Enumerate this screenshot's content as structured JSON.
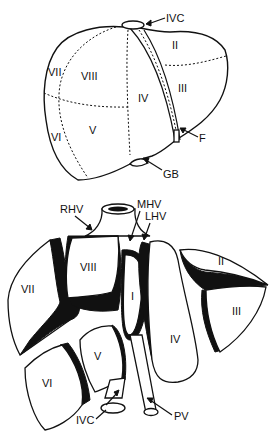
{
  "figure": {
    "top_view": {
      "segment_labels": {
        "II": "II",
        "III": "III",
        "IV": "IV",
        "V": "V",
        "VI": "VI",
        "VII": "VII",
        "VIII": "VIII"
      },
      "annotations": {
        "ivc": "IVC",
        "f": "F",
        "gb": "GB"
      }
    },
    "exploded_view": {
      "segment_labels": {
        "I": "I",
        "II": "II",
        "III": "III",
        "IV": "IV",
        "V": "V",
        "VI": "VI",
        "VII": "VII",
        "VIII": "VIII"
      },
      "annotations": {
        "rhv": "RHV",
        "mhv": "MHV",
        "lhv": "LHV",
        "ivc": "IVC",
        "pv": "PV"
      }
    }
  }
}
